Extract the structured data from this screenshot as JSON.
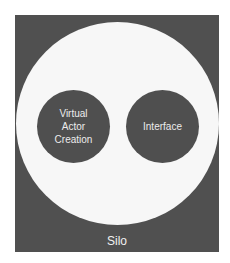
{
  "diagram": {
    "container": {
      "label": "Silo",
      "fill": "#505050"
    },
    "inner_region": {
      "fill": "#f7f7f7"
    },
    "nodes": [
      {
        "label": "Virtual\nActor\nCreation",
        "fill": "#4f4f4f"
      },
      {
        "label": "Interface",
        "fill": "#4f4f4f"
      }
    ]
  }
}
